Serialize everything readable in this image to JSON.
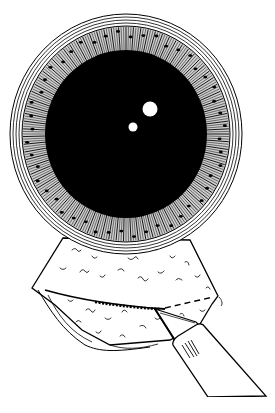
{
  "illustration": {
    "subject": "Eye with iris, pupil and surgical incision below limbus",
    "colors": {
      "background": "#ffffff",
      "ink": "#000000",
      "highlight": "#ffffff"
    },
    "eye": {
      "center": [
        126,
        134
      ],
      "outer_rings_rx": [
        116,
        113,
        110,
        107
      ],
      "outer_rings_ry": [
        120,
        117,
        114,
        111
      ],
      "iris_rx": 104,
      "iris_ry": 108,
      "pupil_rx": 81,
      "pupil_ry": 84,
      "highlights": [
        {
          "cx": 150,
          "cy": 109,
          "r": 7.5
        },
        {
          "cx": 133,
          "cy": 127,
          "r": 4.5
        }
      ]
    },
    "tissue_flap": {
      "label": "conjunctival flap"
    },
    "incision": {
      "label": "incision"
    },
    "instrument": {
      "label": "surgical blade"
    }
  }
}
